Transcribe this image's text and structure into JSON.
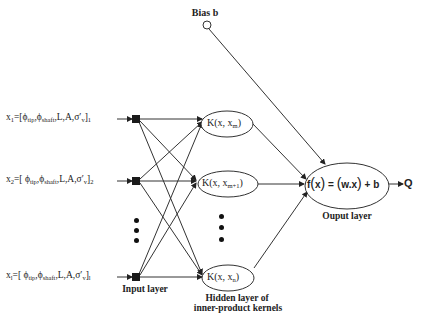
{
  "diagram": {
    "bias": {
      "label": "Bias b"
    },
    "inputs": [
      {
        "var": "x",
        "sub": "1",
        "vector": "=[ϕ",
        "phi1_sub": "tip",
        "phi2": ",ϕ",
        "phi2_sub": "shaft",
        "rest": ",L,A,σ′",
        "sigma_sub": "v",
        "close": "]",
        "close_sub": "1"
      },
      {
        "var": "x",
        "sub": "2",
        "vector": "=[ ϕ",
        "phi1_sub": "tip",
        "phi2": ",ϕ",
        "phi2_sub": "shaft",
        "rest": ",L,A,σ′",
        "sigma_sub": "v",
        "close": "]",
        "close_sub": "2"
      },
      {
        "var": "x",
        "sub": "l",
        "vector": "=[ ϕ",
        "phi1_sub": "tip",
        "phi2": ",ϕ",
        "phi2_sub": "shaft",
        "rest": ",L,A,σ′",
        "sigma_sub": "v",
        "close": "]",
        "close_sub": "l"
      }
    ],
    "kernels": [
      {
        "prefix": "K(x, x",
        "sub": "m",
        "suffix": ")"
      },
      {
        "prefix": "K(x, x",
        "sub": "m+1",
        "suffix": ")"
      },
      {
        "prefix": "K(x, x",
        "sub": "n",
        "suffix": ")"
      }
    ],
    "output_node": {
      "f": "f",
      "x": "x",
      "equals": "=",
      "w": "w",
      "dot": ".",
      "x2": "x",
      "plus_b": "+ b"
    },
    "output_symbol": "Q",
    "layer_labels": {
      "input": "Input layer",
      "hidden_line1": "Hidden layer of",
      "hidden_line2": "inner-product kernels",
      "output": "Ouput layer"
    },
    "ellipsis_glyph": "•",
    "colors": {
      "stroke": "#333333",
      "node_fill": "#1a1a1a",
      "background": "#ffffff"
    }
  }
}
